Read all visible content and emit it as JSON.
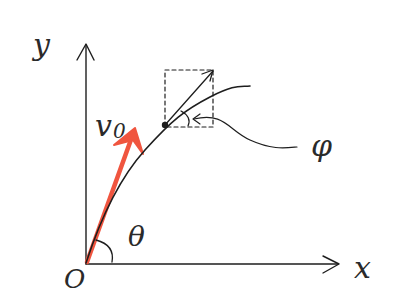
{
  "diagram": {
    "type": "projectile-motion-sketch",
    "labels": {
      "y_axis": "y",
      "x_axis": "x",
      "origin": "O",
      "initial_velocity": "v",
      "initial_velocity_subscript": "0",
      "launch_angle": "θ",
      "tangent_angle": "φ"
    },
    "colors": {
      "ink": "#1e1e1e",
      "velocity_arrow": "#f0553f",
      "background": "#ffffff"
    },
    "elements": {
      "axes": "x and y axes with arrowheads meeting at origin O",
      "trajectory": "curved path rising from origin toward the right",
      "velocity_vector": "red arrow v0 from origin at angle θ to x axis",
      "point": "dot on trajectory with dashed component box and tangent arrow",
      "angle_phi": "angle between tangent arrow and trajectory, pointed out by curved leader line"
    }
  }
}
